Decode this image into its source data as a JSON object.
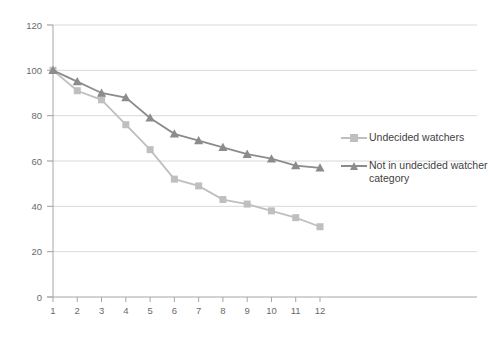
{
  "chart_data": {
    "type": "line",
    "title": "",
    "subtitle": "",
    "xlabel": "",
    "ylabel": "",
    "x": [
      1,
      2,
      3,
      4,
      5,
      6,
      7,
      8,
      9,
      10,
      11,
      12
    ],
    "categories": [
      "1",
      "2",
      "3",
      "4",
      "5",
      "6",
      "7",
      "8",
      "9",
      "10",
      "11",
      "12"
    ],
    "series": [
      {
        "name": "Undecided watchers",
        "marker": "square",
        "color": "#bfbfbf",
        "values": [
          100,
          91,
          87,
          76,
          65,
          52,
          49,
          43,
          41,
          38,
          35,
          31
        ]
      },
      {
        "name": "Not in undecided watcher category",
        "marker": "triangle",
        "color": "#8c8c8c",
        "values": [
          100,
          95,
          90,
          88,
          79,
          72,
          69,
          66,
          63,
          61,
          58,
          57
        ]
      }
    ],
    "xlim": [
      0.5,
      12.5
    ],
    "ylim": [
      0,
      120
    ],
    "yticks": [
      0,
      20,
      40,
      60,
      80,
      100,
      120
    ],
    "ytick_labels": [
      "0",
      "20",
      "40",
      "60",
      "80",
      "100",
      "120"
    ],
    "xticks": [
      1,
      2,
      3,
      4,
      5,
      6,
      7,
      8,
      9,
      10,
      11,
      12
    ],
    "xtick_labels": [
      "1",
      "2",
      "3",
      "4",
      "5",
      "6",
      "7",
      "8",
      "9",
      "10",
      "11",
      "12"
    ],
    "grid": "horizontal",
    "grid_color": "#d9d9d9",
    "axis_color": "#a6a6a6",
    "legend_position": "right",
    "legend": [
      {
        "label": "Undecided watchers",
        "color": "#bfbfbf",
        "marker": "square"
      },
      {
        "label": "Not in undecided watcher category",
        "color": "#8c8c8c",
        "marker": "triangle"
      }
    ]
  },
  "legend": {
    "entries": [
      {
        "label": "Undecided watchers"
      },
      {
        "label": "Not in undecided watcher category"
      }
    ]
  }
}
